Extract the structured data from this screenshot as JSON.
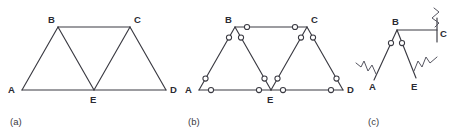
{
  "figure": {
    "type": "engineering-diagram",
    "background_color": "#ffffff",
    "line_color": "#3a3a42",
    "joint_fill_color": "#ffffff"
  },
  "panels": [
    {
      "id": "a",
      "caption": "(a)",
      "caption_x": 10,
      "caption_y": 122,
      "nodes": [
        {
          "label": "A",
          "x": 22,
          "y": 90,
          "label_x": 8,
          "label_y": 93
        },
        {
          "label": "B",
          "x": 58,
          "y": 27,
          "label_x": 48,
          "label_y": 23
        },
        {
          "label": "C",
          "x": 130,
          "y": 27,
          "label_x": 134,
          "label_y": 23
        },
        {
          "label": "D",
          "x": 166,
          "y": 90,
          "label_x": 170,
          "label_y": 93
        },
        {
          "label": "E",
          "x": 94,
          "y": 90,
          "label_x": 90,
          "label_y": 103
        }
      ],
      "members": [
        {
          "from": "A",
          "to": "B"
        },
        {
          "from": "B",
          "to": "C"
        },
        {
          "from": "C",
          "to": "D"
        },
        {
          "from": "A",
          "to": "D"
        },
        {
          "from": "B",
          "to": "E"
        },
        {
          "from": "C",
          "to": "E"
        }
      ]
    },
    {
      "id": "b",
      "caption": "(b)",
      "caption_x": 188,
      "caption_y": 122,
      "nodes": [
        {
          "label": "A",
          "x": 199,
          "y": 90,
          "label_x": 185,
          "label_y": 93
        },
        {
          "label": "B",
          "x": 235,
          "y": 27,
          "label_x": 225,
          "label_y": 23
        },
        {
          "label": "C",
          "x": 307,
          "y": 27,
          "label_x": 311,
          "label_y": 23
        },
        {
          "label": "D",
          "x": 343,
          "y": 90,
          "label_x": 347,
          "label_y": 93
        },
        {
          "label": "E",
          "x": 271,
          "y": 90,
          "label_x": 267,
          "label_y": 103
        }
      ],
      "members": [
        {
          "from": "A",
          "to": "B"
        },
        {
          "from": "B",
          "to": "C"
        },
        {
          "from": "C",
          "to": "D"
        },
        {
          "from": "A",
          "to": "E"
        },
        {
          "from": "E",
          "to": "D"
        },
        {
          "from": "B",
          "to": "E"
        },
        {
          "from": "C",
          "to": "E"
        }
      ],
      "pin_radius": 2.6,
      "pin_note": "open circles mark pin connections at both ends of every member"
    },
    {
      "id": "c",
      "caption": "(c)",
      "caption_x": 368,
      "caption_y": 122,
      "nodes": [
        {
          "label": "B",
          "x": 397,
          "y": 30,
          "label_x": 390,
          "label_y": 25
        },
        {
          "label": "C",
          "x": 437,
          "y": 33,
          "label_x": 441,
          "label_y": 37
        },
        {
          "label": "A",
          "x": 372,
          "y": 80,
          "label_x": 368,
          "label_y": 91
        },
        {
          "label": "E",
          "x": 414,
          "y": 78,
          "label_x": 410,
          "label_y": 91
        }
      ],
      "pin_radius": 2.6,
      "pin_count": 2,
      "break_symbols": [
        "at A",
        "at E",
        "at C"
      ],
      "break_note": "zigzag cut symbols indicate members severed from the rest of the truss"
    }
  ],
  "labels": {
    "A": "A",
    "B": "B",
    "C": "C",
    "D": "D",
    "E": "E"
  },
  "captions": {
    "a": "(a)",
    "b": "(b)",
    "c": "(c)"
  }
}
